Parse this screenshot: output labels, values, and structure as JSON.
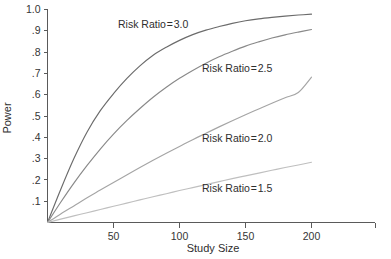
{
  "chart_data": {
    "type": "line",
    "title": "",
    "xlabel": "Study Size",
    "ylabel": "Power",
    "xlim": [
      0,
      240
    ],
    "ylim": [
      0,
      1.0
    ],
    "grid": false,
    "legend_position": "inline-annotations",
    "xticks": [
      50,
      100,
      150,
      200
    ],
    "xtick_labels": [
      "50",
      "100",
      "150",
      "200"
    ],
    "yticks": [
      0.1,
      0.2,
      0.3,
      0.4,
      0.5,
      0.6,
      0.7,
      0.8,
      0.9,
      1.0
    ],
    "ytick_labels": [
      ".1",
      ".2",
      ".3",
      ".4",
      ".5",
      ".6",
      ".7",
      ".8",
      ".9",
      "1.0"
    ],
    "x": [
      0,
      10,
      20,
      30,
      40,
      50,
      60,
      70,
      80,
      90,
      100,
      110,
      120,
      130,
      140,
      150,
      160,
      170,
      180,
      190,
      200
    ],
    "series": [
      {
        "name": "Risk Ratio = 3.0",
        "label": "Risk Ratio = 3.0",
        "color": "#6b6b6b",
        "label_x": 118,
        "label_y": 28,
        "values": [
          0.0,
          0.155,
          0.3,
          0.425,
          0.525,
          0.605,
          0.675,
          0.735,
          0.785,
          0.823,
          0.855,
          0.882,
          0.903,
          0.92,
          0.935,
          0.947,
          0.956,
          0.963,
          0.969,
          0.974,
          0.978
        ]
      },
      {
        "name": "Risk Ratio = 2.5",
        "label": "Risk Ratio = 2.5",
        "color": "#898989",
        "label_x": 202,
        "label_y": 72,
        "values": [
          0.0,
          0.095,
          0.185,
          0.268,
          0.345,
          0.415,
          0.478,
          0.535,
          0.588,
          0.635,
          0.677,
          0.714,
          0.748,
          0.778,
          0.804,
          0.828,
          0.848,
          0.866,
          0.881,
          0.894,
          0.906
        ]
      },
      {
        "name": "Risk Ratio = 2.0",
        "label": "Risk Ratio = 2.0",
        "color": "#a5a5a5",
        "label_x": 202,
        "label_y": 142,
        "values": [
          0.0,
          0.04,
          0.078,
          0.116,
          0.152,
          0.188,
          0.223,
          0.258,
          0.292,
          0.325,
          0.357,
          0.389,
          0.419,
          0.449,
          0.478,
          0.506,
          0.533,
          0.56,
          0.586,
          0.61,
          0.682
        ]
      },
      {
        "name": "Risk Ratio = 1.5",
        "label": "Risk Ratio = 1.5",
        "color": "#bfbfbf",
        "label_x": 202,
        "label_y": 192,
        "values": [
          0.0,
          0.016,
          0.031,
          0.046,
          0.061,
          0.076,
          0.091,
          0.106,
          0.121,
          0.135,
          0.15,
          0.164,
          0.178,
          0.192,
          0.206,
          0.219,
          0.232,
          0.245,
          0.258,
          0.27,
          0.283
        ]
      }
    ]
  },
  "axes": {
    "x_title": "Study Size",
    "y_title": "Power"
  },
  "colors": {
    "axis": "#5a5a5a",
    "text": "#2e2e2e",
    "background": "#ffffff"
  }
}
